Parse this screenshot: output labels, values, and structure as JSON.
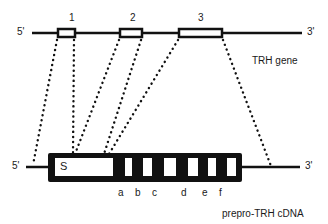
{
  "gene": {
    "label": "TRH gene",
    "five_prime": "5'",
    "three_prime": "3'",
    "exons": [
      {
        "label": "1"
      },
      {
        "label": "2"
      },
      {
        "label": "3"
      }
    ]
  },
  "cdna": {
    "label": "prepro-TRH cDNA",
    "five_prime": "5'",
    "three_prime": "3'",
    "signal_label": "S",
    "segments": [
      {
        "label": "a"
      },
      {
        "label": "b"
      },
      {
        "label": "c"
      },
      {
        "label": "d"
      },
      {
        "label": "e"
      },
      {
        "label": "f"
      }
    ]
  },
  "colors": {
    "ink": "#111111",
    "background": "#ffffff"
  }
}
